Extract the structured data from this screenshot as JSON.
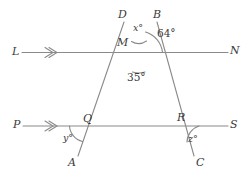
{
  "figure": {
    "type": "geometry-diagram",
    "background_color": "#ffffff",
    "stroke_color": "#8a8a8a",
    "text_color": "#3a3a3a"
  },
  "point_labels": {
    "L": "L",
    "N": "N",
    "P": "P",
    "S": "S",
    "D": "D",
    "B": "B",
    "M": "M",
    "Q": "Q",
    "R": "R",
    "A": "A",
    "C": "C"
  },
  "angle_labels": {
    "x": "x°",
    "sixty_four": "64°",
    "thirty_five": "35°",
    "y": "y°",
    "z": "z°"
  },
  "lines": [
    {
      "name": "LN",
      "label_start": "L",
      "label_end": "N",
      "orientation": "horizontal",
      "arrow_marker": "single-chevron"
    },
    {
      "name": "PS",
      "label_start": "P",
      "label_end": "S",
      "orientation": "horizontal",
      "arrow_marker": "single-chevron"
    },
    {
      "name": "DA",
      "label_start": "D",
      "label_end": "A",
      "orientation": "transversal"
    },
    {
      "name": "BC",
      "label_start": "B",
      "label_end": "C",
      "orientation": "transversal"
    }
  ],
  "intersections": [
    {
      "name": "M",
      "description": "DA and BC meet on line LN"
    },
    {
      "name": "Q",
      "description": "DA meets line PS"
    },
    {
      "name": "R",
      "description": "BC meets line PS"
    }
  ],
  "marked_angles": [
    {
      "vertex": "M",
      "label": "x°",
      "between": "MD and MB"
    },
    {
      "vertex": "M",
      "label": "64°",
      "between": "MB and MN"
    },
    {
      "vertex": "M",
      "label": "35°",
      "between": "MA and MC"
    },
    {
      "vertex": "Q",
      "label": "y°",
      "between": "QP and QA"
    },
    {
      "vertex": "R",
      "label": "z°",
      "between": "RS and RC"
    }
  ]
}
